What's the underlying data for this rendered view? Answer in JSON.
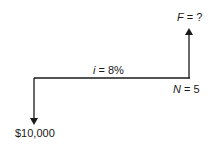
{
  "diagram": {
    "type": "cash-flow-diagram",
    "interest_rate": {
      "var": "i",
      "eq": " = ",
      "value": "8%"
    },
    "periods": {
      "var": "N",
      "eq": " = ",
      "value": "5"
    },
    "future_value": {
      "var": "F",
      "eq": " = ",
      "value": "?"
    },
    "present_value": {
      "label": "$10,000"
    },
    "colors": {
      "line": "#1a1a1a",
      "background": "#ffffff"
    }
  }
}
